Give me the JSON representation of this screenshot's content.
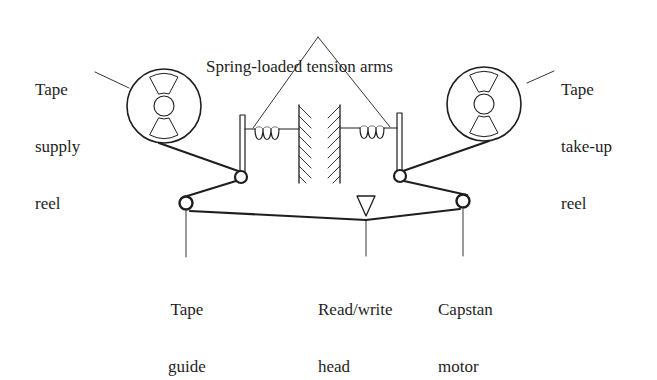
{
  "diagram": {
    "labels": {
      "tension_arms": "Spring-loaded tension arms",
      "supply_reel": [
        "Tape",
        "supply",
        "reel"
      ],
      "takeup_reel": [
        "Tape",
        "take-up",
        "reel"
      ],
      "tape_guide": [
        "Tape",
        "guide"
      ],
      "read_write_head": [
        "Read/write",
        "head"
      ],
      "capstan_motor": [
        "Capstan",
        "motor"
      ]
    },
    "colors": {
      "ink": "#1e1e1e",
      "background": "#ffffff"
    },
    "components": [
      {
        "name": "Tape supply reel",
        "type": "reel",
        "cx": 164,
        "cy": 106,
        "r": 37
      },
      {
        "name": "Tape take-up reel",
        "type": "reel",
        "cx": 484,
        "cy": 104,
        "r": 37
      },
      {
        "name": "Left tension arm",
        "type": "spring-arm",
        "x": 243
      },
      {
        "name": "Right tension arm",
        "type": "spring-arm",
        "x": 398
      },
      {
        "name": "Tape guide",
        "type": "roller",
        "cx": 186,
        "cy": 203
      },
      {
        "name": "Capstan motor",
        "type": "roller",
        "cx": 463,
        "cy": 201
      },
      {
        "name": "Read/write head",
        "type": "head",
        "x": 366,
        "y": 215
      }
    ]
  }
}
